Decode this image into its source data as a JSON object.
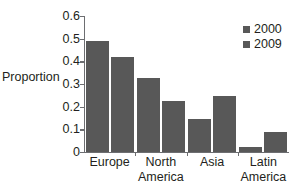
{
  "chart_data": {
    "type": "bar",
    "title": "",
    "subtitle": "",
    "xlabel": "",
    "ylabel": "Proportion",
    "categories": [
      "Europe",
      "North America",
      "Asia",
      "Latin America"
    ],
    "category_lines": [
      [
        "Europe"
      ],
      [
        "North",
        "America"
      ],
      [
        "Asia"
      ],
      [
        "Latin",
        "America"
      ]
    ],
    "series": [
      {
        "name": "2000",
        "values": [
          0.49,
          0.325,
          0.145,
          0.023
        ],
        "color": "#585858"
      },
      {
        "name": "2009",
        "values": [
          0.42,
          0.225,
          0.245,
          0.09
        ],
        "color": "#585858"
      }
    ],
    "ylim": [
      0,
      0.6
    ],
    "ytick_values": [
      0,
      0.1,
      0.2,
      0.3,
      0.4,
      0.5,
      0.6
    ],
    "ytick_labels": [
      "0",
      "0.1",
      "0.2",
      "0.3",
      "0.4",
      "0.5",
      "0.6"
    ],
    "grid": false,
    "legend_position": "top-right",
    "legend_entries": [
      "2000",
      "2009"
    ],
    "annotations": []
  },
  "colors": {
    "bar": "#585858",
    "axis": "#6d6e71",
    "text": "#231f20",
    "background": "#ffffff"
  }
}
